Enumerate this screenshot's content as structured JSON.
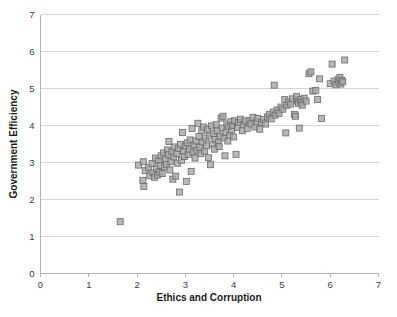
{
  "chart_data": {
    "type": "scatter",
    "title": "",
    "xlabel": "Ethics and Corruption",
    "ylabel": "Government Efficiency",
    "xlim": [
      0,
      7
    ],
    "ylim": [
      0,
      7
    ],
    "xticks": [
      "0",
      "1",
      "2",
      "3",
      "4",
      "5",
      "6",
      "7"
    ],
    "yticks": [
      "0",
      "1",
      "2",
      "3",
      "4",
      "5",
      "6",
      "7"
    ],
    "grid": "horizontal",
    "legend": "none",
    "marker": {
      "shape": "square",
      "fill_color": "#a8a8a8",
      "edge_color": "#6f6f6f",
      "size_px": 6
    },
    "n_points": 161,
    "points": [
      [
        1.65,
        1.4
      ],
      [
        2.03,
        2.93
      ],
      [
        2.13,
        3.02
      ],
      [
        2.12,
        2.52
      ],
      [
        2.14,
        2.35
      ],
      [
        2.17,
        2.78
      ],
      [
        2.24,
        2.86
      ],
      [
        2.26,
        2.64
      ],
      [
        2.31,
        2.97
      ],
      [
        2.33,
        2.72
      ],
      [
        2.36,
        2.6
      ],
      [
        2.38,
        3.12
      ],
      [
        2.4,
        2.83
      ],
      [
        2.42,
        2.66
      ],
      [
        2.44,
        3.05
      ],
      [
        2.46,
        2.74
      ],
      [
        2.48,
        2.92
      ],
      [
        2.5,
        3.18
      ],
      [
        2.52,
        2.7
      ],
      [
        2.55,
        3.26
      ],
      [
        2.57,
        2.88
      ],
      [
        2.59,
        3.1
      ],
      [
        2.61,
        2.95
      ],
      [
        2.63,
        3.34
      ],
      [
        2.65,
        3.21
      ],
      [
        2.66,
        3.57
      ],
      [
        2.68,
        2.8
      ],
      [
        2.7,
        3.02
      ],
      [
        2.72,
        3.29
      ],
      [
        2.74,
        2.55
      ],
      [
        2.76,
        3.15
      ],
      [
        2.78,
        3.42
      ],
      [
        2.8,
        2.63
      ],
      [
        2.82,
        3.24
      ],
      [
        2.84,
        2.98
      ],
      [
        2.86,
        3.38
      ],
      [
        2.88,
        2.2
      ],
      [
        2.9,
        3.49
      ],
      [
        2.92,
        3.06
      ],
      [
        2.94,
        3.81
      ],
      [
        2.96,
        3.3
      ],
      [
        2.98,
        3.16
      ],
      [
        3.0,
        3.44
      ],
      [
        3.02,
        2.49
      ],
      [
        3.04,
        3.53
      ],
      [
        3.06,
        3.22
      ],
      [
        3.08,
        3.36
      ],
      [
        3.1,
        3.61
      ],
      [
        3.12,
        2.76
      ],
      [
        3.14,
        3.92
      ],
      [
        3.16,
        3.28
      ],
      [
        3.18,
        3.47
      ],
      [
        3.2,
        3.12
      ],
      [
        3.22,
        3.58
      ],
      [
        3.24,
        3.33
      ],
      [
        3.26,
        4.06
      ],
      [
        3.28,
        3.7
      ],
      [
        3.3,
        3.41
      ],
      [
        3.32,
        3.24
      ],
      [
        3.34,
        3.86
      ],
      [
        3.36,
        3.55
      ],
      [
        3.38,
        3.96
      ],
      [
        3.4,
        3.31
      ],
      [
        3.42,
        3.66
      ],
      [
        3.44,
        3.45
      ],
      [
        3.46,
        3.9
      ],
      [
        3.48,
        3.13
      ],
      [
        3.5,
        3.72
      ],
      [
        3.52,
        2.94
      ],
      [
        3.54,
        3.99
      ],
      [
        3.56,
        3.5
      ],
      [
        3.58,
        3.78
      ],
      [
        3.6,
        3.36
      ],
      [
        3.62,
        3.62
      ],
      [
        3.64,
        4.02
      ],
      [
        3.66,
        3.85
      ],
      [
        3.68,
        3.55
      ],
      [
        3.7,
        3.43
      ],
      [
        3.72,
        3.71
      ],
      [
        3.74,
        4.2
      ],
      [
        3.76,
        3.93
      ],
      [
        3.78,
        4.25
      ],
      [
        3.8,
        3.66
      ],
      [
        3.82,
        3.18
      ],
      [
        3.84,
        3.82
      ],
      [
        3.86,
        4.04
      ],
      [
        3.88,
        3.58
      ],
      [
        3.9,
        3.97
      ],
      [
        3.92,
        3.74
      ],
      [
        3.94,
        4.1
      ],
      [
        3.96,
        3.88
      ],
      [
        3.98,
        4.0
      ],
      [
        4.0,
        3.69
      ],
      [
        4.02,
        4.13
      ],
      [
        4.05,
        3.22
      ],
      [
        4.08,
        3.95
      ],
      [
        4.1,
        4.08
      ],
      [
        4.14,
        4.17
      ],
      [
        4.18,
        3.86
      ],
      [
        4.2,
        4.02
      ],
      [
        4.24,
        4.12
      ],
      [
        4.28,
        3.92
      ],
      [
        4.32,
        4.14
      ],
      [
        4.36,
        4.04
      ],
      [
        4.4,
        4.22
      ],
      [
        4.44,
        3.96
      ],
      [
        4.48,
        4.1
      ],
      [
        4.5,
        4.19
      ],
      [
        4.54,
        3.9
      ],
      [
        4.58,
        4.08
      ],
      [
        4.62,
        4.16
      ],
      [
        4.66,
        4.04
      ],
      [
        4.7,
        4.23
      ],
      [
        4.74,
        4.3
      ],
      [
        4.78,
        4.18
      ],
      [
        4.82,
        4.36
      ],
      [
        4.84,
        5.09
      ],
      [
        4.86,
        4.28
      ],
      [
        4.9,
        4.42
      ],
      [
        4.94,
        4.33
      ],
      [
        4.98,
        4.5
      ],
      [
        5.02,
        4.44
      ],
      [
        5.06,
        4.7
      ],
      [
        5.08,
        3.8
      ],
      [
        5.1,
        4.55
      ],
      [
        5.14,
        4.64
      ],
      [
        5.18,
        4.58
      ],
      [
        5.22,
        4.72
      ],
      [
        5.26,
        4.3
      ],
      [
        5.28,
        4.25
      ],
      [
        5.3,
        4.78
      ],
      [
        5.32,
        4.66
      ],
      [
        5.34,
        4.6
      ],
      [
        5.36,
        3.93
      ],
      [
        5.38,
        4.7
      ],
      [
        5.4,
        4.62
      ],
      [
        5.42,
        4.55
      ],
      [
        5.46,
        4.74
      ],
      [
        5.5,
        4.66
      ],
      [
        5.56,
        5.4
      ],
      [
        5.6,
        5.45
      ],
      [
        5.64,
        4.93
      ],
      [
        5.7,
        4.95
      ],
      [
        5.74,
        4.7
      ],
      [
        5.78,
        5.26
      ],
      [
        5.82,
        4.19
      ],
      [
        6.0,
        5.13
      ],
      [
        6.04,
        5.66
      ],
      [
        6.08,
        5.2
      ],
      [
        6.12,
        5.1
      ],
      [
        6.16,
        5.24
      ],
      [
        6.18,
        5.16
      ],
      [
        6.2,
        5.3
      ],
      [
        6.22,
        5.12
      ],
      [
        6.24,
        5.22
      ],
      [
        6.26,
        5.18
      ],
      [
        6.3,
        5.77
      ]
    ]
  }
}
